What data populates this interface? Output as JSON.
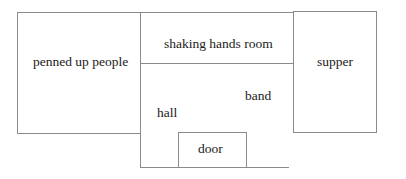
{
  "diagram": {
    "type": "floor-plan",
    "rooms": [
      {
        "id": "penned",
        "label": "penned up people"
      },
      {
        "id": "shaking",
        "label": "shaking hands room"
      },
      {
        "id": "supper",
        "label": "supper"
      },
      {
        "id": "hall",
        "label": "hall"
      },
      {
        "id": "band",
        "label": "band"
      },
      {
        "id": "door",
        "label": "door"
      }
    ],
    "line_color": "#8a8a8a",
    "text_color": "#1a1a1a"
  }
}
